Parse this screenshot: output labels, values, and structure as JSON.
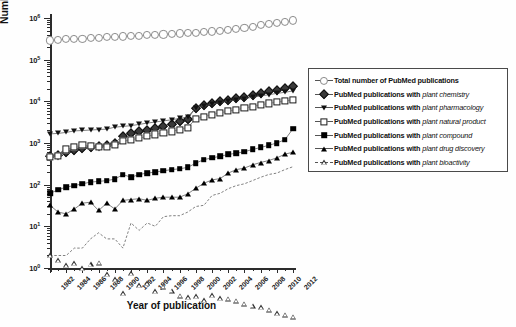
{
  "chart_data": {
    "type": "line",
    "title": "",
    "xlabel": "Year of publication",
    "ylabel": "Number of PubMed publications",
    "yscale": "log",
    "ylim": [
      1,
      1000000
    ],
    "xlim": [
      1982,
      2012
    ],
    "grid": false,
    "legend_position": "right",
    "ytick_labels": [
      "10⁰",
      "10¹",
      "10²",
      "10³",
      "10⁴",
      "10⁵",
      "10⁶"
    ],
    "ytick_values": [
      1,
      10,
      100,
      1000,
      10000,
      100000,
      1000000
    ],
    "xtick_labels": [
      "1982",
      "1984",
      "1986",
      "1988",
      "1990",
      "1992",
      "1994",
      "1996",
      "1998",
      "2000",
      "2002",
      "2004",
      "2006",
      "2008",
      "2010",
      "2012"
    ],
    "x": [
      1982,
      1983,
      1984,
      1985,
      1986,
      1987,
      1988,
      1989,
      1990,
      1991,
      1992,
      1993,
      1994,
      1995,
      1996,
      1997,
      1998,
      1999,
      2000,
      2001,
      2002,
      2003,
      2004,
      2005,
      2006,
      2007,
      2008,
      2009,
      2010,
      2011,
      2012
    ],
    "series": [
      {
        "name": "Total number of PubMed publications",
        "marker": "open-circle",
        "values": [
          290000,
          300000,
          308000,
          315000,
          322000,
          330000,
          338000,
          345000,
          355000,
          362000,
          370000,
          378000,
          385000,
          395000,
          405000,
          415000,
          425000,
          435000,
          448000,
          462000,
          478000,
          495000,
          520000,
          550000,
          585000,
          625000,
          668000,
          712000,
          760000,
          820000,
          880000
        ]
      },
      {
        "name": "PubMed publications with plant chemistry",
        "term": "plant chemistry",
        "marker": "filled-diamond",
        "values": [
          480,
          520,
          600,
          680,
          760,
          800,
          860,
          900,
          1000,
          1500,
          1700,
          1900,
          2100,
          2350,
          2600,
          2900,
          3300,
          3800,
          7000,
          8200,
          9200,
          10000,
          11000,
          12000,
          13000,
          14500,
          16000,
          17500,
          19000,
          21000,
          23000
        ]
      },
      {
        "name": "PubMed publications with plant pharmacology",
        "term": "plant pharmacology",
        "marker": "filled-down-triangle",
        "values": [
          1650,
          1700,
          1800,
          1950,
          2000,
          2050,
          2100,
          2150,
          2400,
          2500,
          2600,
          2800,
          3000,
          3200,
          3400,
          3600,
          3900,
          4200,
          7000,
          7800,
          8600,
          9300,
          10000,
          10800,
          11600,
          12500,
          13400,
          14400,
          15500,
          16500,
          17800
        ]
      },
      {
        "name": "PubMed publications with plant natural product",
        "term": "plant natural product",
        "marker": "open-square",
        "values": [
          460,
          500,
          700,
          800,
          900,
          850,
          800,
          820,
          900,
          1100,
          1200,
          1300,
          1450,
          1600,
          1750,
          1900,
          2100,
          2350,
          3800,
          4300,
          4800,
          5300,
          5800,
          6300,
          6900,
          7500,
          8200,
          8900,
          9600,
          10200,
          10800
        ]
      },
      {
        "name": "PubMed publications with plant compound",
        "term": "plant compound",
        "marker": "filled-square",
        "values": [
          62,
          75,
          88,
          95,
          105,
          115,
          120,
          125,
          135,
          175,
          150,
          175,
          190,
          200,
          215,
          230,
          240,
          260,
          330,
          400,
          440,
          480,
          530,
          570,
          620,
          700,
          780,
          880,
          1000,
          1200,
          2200
        ]
      },
      {
        "name": "PubMed publications with plant drug discovery",
        "term": "plant drug discovery",
        "marker": "filled-up-triangle",
        "values": [
          32,
          22,
          20,
          26,
          36,
          38,
          24,
          36,
          26,
          42,
          44,
          46,
          42,
          47,
          50,
          50,
          50,
          60,
          82,
          108,
          130,
          140,
          190,
          230,
          250,
          300,
          340,
          380,
          440,
          540,
          600
        ]
      },
      {
        "name": "PubMed publications with plant bioactivity",
        "term": "plant bioactivity",
        "marker": "open-up-triangle",
        "values": [
          2,
          2,
          2,
          3,
          3,
          5,
          7,
          5,
          5,
          3,
          12,
          8,
          12,
          10,
          17,
          18,
          18,
          22,
          30,
          32,
          55,
          62,
          80,
          95,
          105,
          125,
          150,
          175,
          190,
          230,
          270
        ]
      }
    ]
  },
  "legend": {
    "prefix": "PubMed publications with",
    "entries": [
      {
        "label": "Total number of PubMed publications",
        "term": "",
        "marker": "open-circle"
      },
      {
        "label": "PubMed publications with",
        "term": "plant chemistry",
        "marker": "filled-diamond"
      },
      {
        "label": "PubMed publications with",
        "term": "plant pharmacology",
        "marker": "filled-down-triangle"
      },
      {
        "label": "PubMed publications with",
        "term": "plant natural product",
        "marker": "open-square"
      },
      {
        "label": "PubMed publications with",
        "term": "plant compound",
        "marker": "filled-square"
      },
      {
        "label": "PubMed publications with",
        "term": "plant drug discovery",
        "marker": "filled-up-triangle"
      },
      {
        "label": "PubMed publications with",
        "term": "plant bioactivity",
        "marker": "open-up-triangle"
      }
    ]
  },
  "axes": {
    "x_title": "Year of publication",
    "y_title": "Number of PubMed publications"
  }
}
